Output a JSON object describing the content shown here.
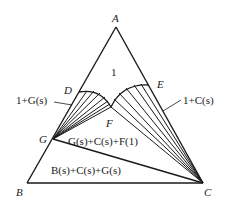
{
  "diagram": {
    "type": "ternary-phase-diagram",
    "vertices": {
      "A": "A",
      "B": "B",
      "C": "C"
    },
    "points": {
      "D": "D",
      "E": "E",
      "F": "F",
      "G": "G"
    },
    "regions": {
      "liquid": "1",
      "liquid_G": "1+G(s)",
      "liquid_C": "1+C(s)",
      "three_phase_upper": "G(s)+C(s)+F(1)",
      "three_phase_lower": "B(s)+C(s)+G(s)"
    }
  }
}
